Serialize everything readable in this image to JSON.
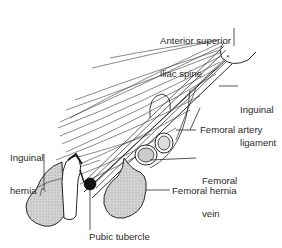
{
  "diagram": {
    "labels": {
      "asis_line1": "Anterior superior",
      "asis_line2": "iliac spine",
      "inguinal_ligament_line1": "Inguinal",
      "inguinal_ligament_line2": "ligament",
      "femoral_artery": "Femoral artery",
      "femoral_vein_line1": "Femoral",
      "femoral_vein_line2": "vein",
      "femoral_hernia": "Femoral hernia",
      "inguinal_hernia_line1": "Inguinal",
      "inguinal_hernia_line2": "hernia",
      "pubic_tubercle": "Pubic tubercle"
    },
    "colors": {
      "line": "#2a2a2a",
      "hernia_fill": "#c9c9c9",
      "tubercle_fill": "#111111",
      "background": "#ffffff"
    }
  }
}
